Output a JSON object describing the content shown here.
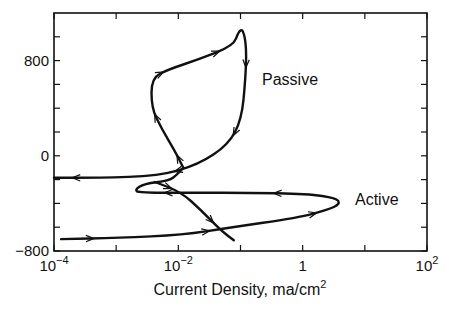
{
  "chart_data": {
    "type": "line",
    "title": "",
    "xlabel": "Current Density, ma/cm²",
    "ylabel": "",
    "xscale": "log",
    "xlim": [
      0.0001,
      100
    ],
    "ylim": [
      -800,
      1200
    ],
    "grid": false,
    "legend": null,
    "x_ticks": [
      {
        "value": 0.0001,
        "label_base": "10",
        "label_exp": "−4"
      },
      {
        "value": 0.01,
        "label_base": "10",
        "label_exp": "−2"
      },
      {
        "value": 1,
        "label_base": "1",
        "label_exp": ""
      },
      {
        "value": 100,
        "label_base": "10",
        "label_exp": "2"
      }
    ],
    "x_minor_ticks": [
      0.001,
      0.1,
      10
    ],
    "y_ticks": [
      {
        "value": 800,
        "label": "800"
      },
      {
        "value": 0,
        "label": "0"
      },
      {
        "value": -800,
        "label": "−800"
      }
    ],
    "y_minor_ticks": [
      1000,
      600,
      400,
      200,
      -200,
      -400,
      -600
    ],
    "annotations": [
      {
        "text": "Passive",
        "x": 0.35,
        "y": 650
      },
      {
        "text": "Active",
        "x": 8,
        "y": -370
      }
    ],
    "series": [
      {
        "name": "Active",
        "description": "Forward anodic sweep from about -700 mV, reaching ~4 ma/cm2 near -400 mV then reversing",
        "points": [
          {
            "i": 0.00013,
            "E": -700
          },
          {
            "i": 0.0011,
            "E": -690
          },
          {
            "i": 0.012,
            "E": -665
          },
          {
            "i": 0.063,
            "E": -605
          },
          {
            "i": 0.84,
            "E": -520
          },
          {
            "i": 2.5,
            "E": -455
          },
          {
            "i": 4.0,
            "E": -405
          },
          {
            "i": 3.5,
            "E": -355
          },
          {
            "i": 1.2,
            "E": -320
          },
          {
            "i": 0.13,
            "E": -310
          },
          {
            "i": 0.021,
            "E": -310
          },
          {
            "i": 0.0023,
            "E": -310
          },
          {
            "i": 0.002,
            "E": -285
          },
          {
            "i": 0.0028,
            "E": -235
          },
          {
            "i": 0.0071,
            "E": -210
          },
          {
            "i": 0.0095,
            "E": -160
          },
          {
            "i": 0.012,
            "E": -100
          }
        ]
      },
      {
        "name": "Passive",
        "description": "Passive loop rising to ~1050 mV near 0.1 ma/cm2 and returning",
        "points": [
          {
            "i": 0.012,
            "E": -100
          },
          {
            "i": 0.0086,
            "E": 50
          },
          {
            "i": 0.0053,
            "E": 235
          },
          {
            "i": 0.0037,
            "E": 405
          },
          {
            "i": 0.0037,
            "E": 655
          },
          {
            "i": 0.0069,
            "E": 725
          },
          {
            "i": 0.021,
            "E": 810
          },
          {
            "i": 0.077,
            "E": 925
          },
          {
            "i": 0.093,
            "E": 1045
          },
          {
            "i": 0.11,
            "E": 1065
          },
          {
            "i": 0.125,
            "E": 910
          },
          {
            "i": 0.12,
            "E": 640
          },
          {
            "i": 0.104,
            "E": 305
          },
          {
            "i": 0.064,
            "E": 95
          },
          {
            "i": 0.021,
            "E": -75
          },
          {
            "i": 0.0048,
            "E": -170
          },
          {
            "i": 0.00052,
            "E": -185
          },
          {
            "i": 0.0001,
            "E": -185
          }
        ]
      },
      {
        "name": "Cathodic branch",
        "description": "Curve crossing the active loop descending toward ~0.05 ma/cm2 at -700 mV",
        "points": [
          {
            "i": 0.0042,
            "E": -220
          },
          {
            "i": 0.011,
            "E": -305
          },
          {
            "i": 0.023,
            "E": -455
          },
          {
            "i": 0.048,
            "E": -625
          },
          {
            "i": 0.078,
            "E": -710
          }
        ]
      }
    ]
  },
  "labels": {
    "xlabel_main": "Current Density, ma/cm",
    "xlabel_sup": "2",
    "passive": "Passive",
    "active": "Active"
  }
}
